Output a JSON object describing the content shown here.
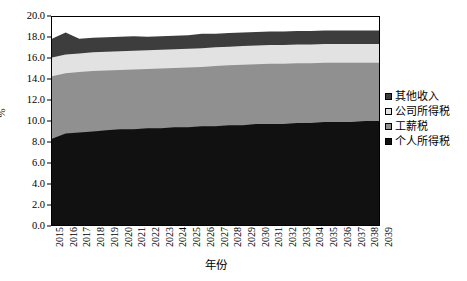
{
  "chart_data": {
    "type": "area",
    "title": "",
    "subtitle": "",
    "xlabel": "年份",
    "ylabel": "%",
    "ylim": [
      0.0,
      20.0
    ],
    "ytick_step": 2.0,
    "grid": false,
    "stacked": true,
    "legend_position": "right",
    "ytick_labels": [
      "20.0",
      "18.0",
      "16.0",
      "14.0",
      "12.0",
      "10.0",
      "8.0",
      "6.0",
      "4.0",
      "2.0",
      "0.0"
    ],
    "ytick_values": [
      20.0,
      18.0,
      16.0,
      14.0,
      12.0,
      10.0,
      8.0,
      6.0,
      4.0,
      2.0,
      0.0
    ],
    "categories": [
      "2015",
      "2016",
      "2017",
      "2018",
      "2019",
      "2020",
      "2021",
      "2022",
      "2023",
      "2024",
      "2025",
      "2026",
      "2027",
      "2028",
      "2029",
      "2030",
      "2031",
      "2032",
      "2033",
      "2034",
      "2035",
      "2036",
      "2037",
      "2038",
      "2039"
    ],
    "legend_order_top_to_bottom": [
      "其他收入",
      "公司所得税",
      "工薪税",
      "个人所得税"
    ],
    "series": [
      {
        "name": "个人所得税",
        "color": "#111111",
        "stack_order": 1,
        "values": [
          8.3,
          8.8,
          8.9,
          9.0,
          9.1,
          9.2,
          9.2,
          9.3,
          9.3,
          9.4,
          9.4,
          9.5,
          9.5,
          9.6,
          9.6,
          9.7,
          9.7,
          9.7,
          9.8,
          9.8,
          9.9,
          9.9,
          9.9,
          10.0,
          10.0
        ]
      },
      {
        "name": "工薪税",
        "color": "#909090",
        "stack_order": 2,
        "values": [
          6.0,
          5.8,
          5.8,
          5.8,
          5.8,
          5.8,
          5.8,
          5.8,
          5.8,
          5.8,
          5.8,
          5.8,
          5.8,
          5.8,
          5.8,
          5.8,
          5.8,
          5.8,
          5.8,
          5.8,
          5.8,
          5.8,
          5.7,
          5.7,
          5.6
        ]
      },
      {
        "name": "公司所得税",
        "color": "#e2e2e2",
        "stack_order": 3,
        "values": [
          1.8,
          1.8,
          1.8,
          1.8,
          1.8,
          1.8,
          1.8,
          1.8,
          1.8,
          1.8,
          1.8,
          1.8,
          1.8,
          1.8,
          1.8,
          1.8,
          1.8,
          1.8,
          1.8,
          1.8,
          1.8,
          1.8,
          1.8,
          1.8,
          1.8
        ]
      },
      {
        "name": "其他收入",
        "color": "#3d3d3d",
        "stack_order": 4,
        "values": [
          1.8,
          2.1,
          1.4,
          1.4,
          1.4,
          1.4,
          1.4,
          1.3,
          1.3,
          1.3,
          1.3,
          1.4,
          1.3,
          1.3,
          1.3,
          1.3,
          1.3,
          1.3,
          1.3,
          1.3,
          1.3,
          1.3,
          1.3,
          1.3,
          1.3
        ]
      }
    ],
    "cumulative_top_boundaries": {
      "个人所得税": [
        8.3,
        8.8,
        8.9,
        9.0,
        9.1,
        9.2,
        9.2,
        9.3,
        9.3,
        9.4,
        9.4,
        9.5,
        9.5,
        9.6,
        9.6,
        9.7,
        9.7,
        9.7,
        9.8,
        9.8,
        9.9,
        9.9,
        9.9,
        10.0,
        10.0
      ],
      "工薪税": [
        14.3,
        14.6,
        14.7,
        14.8,
        14.85,
        14.9,
        14.95,
        15.0,
        15.05,
        15.1,
        15.15,
        15.2,
        15.3,
        15.35,
        15.4,
        15.45,
        15.5,
        15.5,
        15.55,
        15.55,
        15.6,
        15.6,
        15.6,
        15.6,
        15.6
      ],
      "公司所得税": [
        16.1,
        16.4,
        16.5,
        16.6,
        16.65,
        16.7,
        16.75,
        16.8,
        16.85,
        16.9,
        16.95,
        17.0,
        17.1,
        17.15,
        17.2,
        17.25,
        17.3,
        17.3,
        17.35,
        17.35,
        17.4,
        17.4,
        17.4,
        17.4,
        17.4
      ],
      "其他收入": [
        17.9,
        18.5,
        17.9,
        18.0,
        18.05,
        18.1,
        18.15,
        18.1,
        18.15,
        18.2,
        18.25,
        18.4,
        18.4,
        18.45,
        18.5,
        18.55,
        18.6,
        18.6,
        18.65,
        18.65,
        18.7,
        18.7,
        18.7,
        18.7,
        18.7
      ]
    }
  },
  "legend": {
    "items": [
      {
        "label": "其他收入",
        "color": "#3d3d3d"
      },
      {
        "label": "公司所得税",
        "color": "#e2e2e2"
      },
      {
        "label": "工薪税",
        "color": "#909090"
      },
      {
        "label": "个人所得税",
        "color": "#111111"
      }
    ]
  }
}
